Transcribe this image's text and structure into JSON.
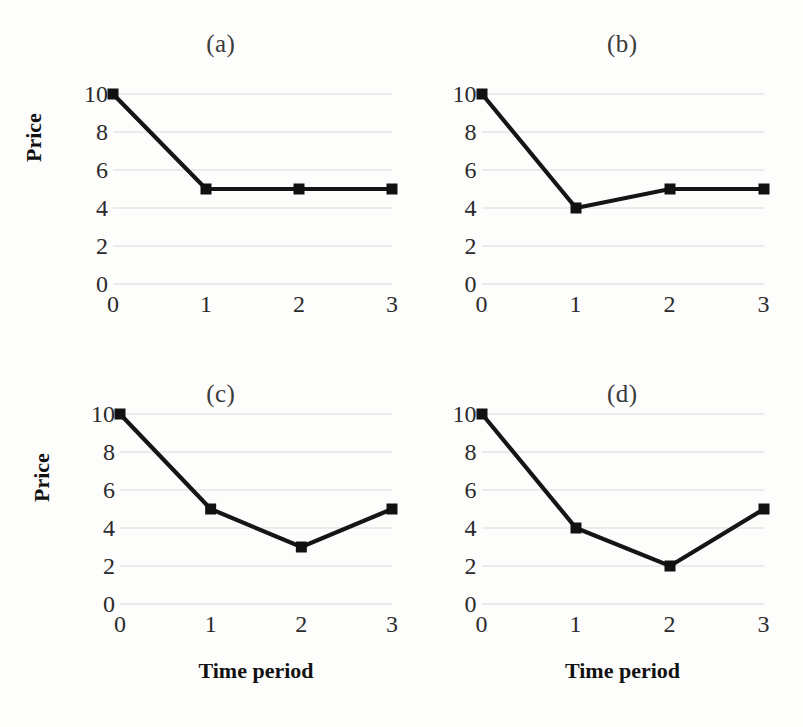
{
  "figure": {
    "background_color": "#fdfdfc",
    "line_color": "#151515",
    "grid_color": "#d9d9d9",
    "layout": "2x2 grid of line charts"
  },
  "chart_data": [
    {
      "type": "line",
      "title": "(a)",
      "xlabel": "",
      "ylabel": "Price",
      "x": [
        0,
        1,
        2,
        3
      ],
      "values": [
        10,
        5,
        5,
        5
      ],
      "xticklabels": [
        "0",
        "1",
        "2",
        "3"
      ],
      "yticklabels": [
        "0",
        "2",
        "4",
        "6",
        "8",
        "10"
      ],
      "xlim": [
        0,
        3
      ],
      "ylim": [
        0,
        10
      ],
      "grid": "horizontal",
      "legend": "none",
      "marker": "square"
    },
    {
      "type": "line",
      "title": "(b)",
      "xlabel": "",
      "ylabel": "",
      "x": [
        0,
        1,
        2,
        3
      ],
      "values": [
        10,
        4,
        5,
        5
      ],
      "xticklabels": [
        "0",
        "1",
        "2",
        "3"
      ],
      "yticklabels": [
        "0",
        "2",
        "4",
        "6",
        "8",
        "10"
      ],
      "xlim": [
        0,
        3
      ],
      "ylim": [
        0,
        10
      ],
      "grid": "horizontal",
      "legend": "none",
      "marker": "square"
    },
    {
      "type": "line",
      "title": "(c)",
      "xlabel": "Time period",
      "ylabel": "Price",
      "x": [
        0,
        1,
        2,
        3
      ],
      "values": [
        10,
        5,
        3,
        5
      ],
      "xticklabels": [
        "0",
        "1",
        "2",
        "3"
      ],
      "yticklabels": [
        "0",
        "2",
        "4",
        "6",
        "8",
        "10"
      ],
      "xlim": [
        0,
        3
      ],
      "ylim": [
        0,
        10
      ],
      "grid": "horizontal",
      "legend": "none",
      "marker": "square"
    },
    {
      "type": "line",
      "title": "(d)",
      "xlabel": "Time period",
      "ylabel": "",
      "x": [
        0,
        1,
        2,
        3
      ],
      "values": [
        10,
        4,
        2,
        5
      ],
      "xticklabels": [
        "0",
        "1",
        "2",
        "3"
      ],
      "yticklabels": [
        "0",
        "2",
        "4",
        "6",
        "8",
        "10"
      ],
      "xlim": [
        0,
        3
      ],
      "ylim": [
        0,
        10
      ],
      "grid": "horizontal",
      "legend": "none",
      "marker": "square"
    }
  ]
}
